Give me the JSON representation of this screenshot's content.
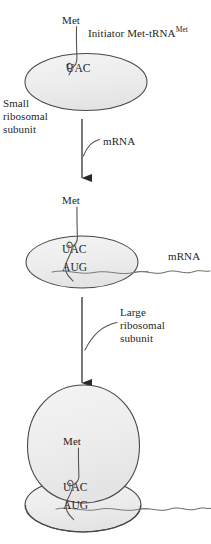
{
  "figure": {
    "stages": [
      {
        "id": "stage-1",
        "name": "small-subunit-with-initiator-trna",
        "labels": {
          "met": "Met",
          "initiator_trna": "Initiator Met-tRNA",
          "initiator_trna_superscript": "Met",
          "anticodon": "UAC",
          "subunit": "Small\nribosomal\nsubunit"
        }
      },
      {
        "id": "stage-2",
        "name": "small-subunit-bound-to-mrna",
        "labels": {
          "met": "Met",
          "anticodon": "UAC",
          "codon": "AUG",
          "mrna": "mRNA"
        }
      },
      {
        "id": "stage-3",
        "name": "complete-ribosome-initiation-complex",
        "labels": {
          "met": "Met",
          "anticodon": "UAC",
          "codon": "AUG"
        }
      }
    ],
    "transitions": [
      {
        "id": "arrow-1",
        "name": "mrna-binding-step",
        "label": "mRNA"
      },
      {
        "id": "arrow-2",
        "name": "large-subunit-joining-step",
        "label": "Large\nribosomal\nsubunit"
      }
    ],
    "colors": {
      "outline": "#4a4744",
      "subunit_fill": "#eeeeee",
      "strand": "#5a5754",
      "text": "#231f1e",
      "background": "#ffffff"
    }
  }
}
